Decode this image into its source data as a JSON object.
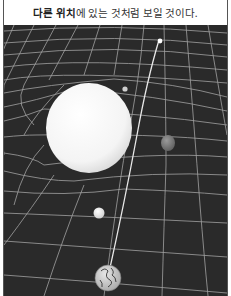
{
  "caption": {
    "bold_text": "다른 위치",
    "rest_text": "에 있는 것처럼 보일 것이다."
  },
  "scene": {
    "description": "Curved spacetime grid with a large white mass bending the path of light from a distant star to Earth",
    "background_color": "#2b2b2b",
    "grid_color": "#bdbdbd",
    "objects": [
      {
        "name": "distant-star",
        "label": "star"
      },
      {
        "name": "large-mass",
        "label": "massive sphere"
      },
      {
        "name": "small-moon",
        "label": "small body"
      },
      {
        "name": "planet",
        "label": "planet"
      },
      {
        "name": "small-planet",
        "label": "small white body"
      },
      {
        "name": "earth",
        "label": "Earth"
      }
    ],
    "light_path": "line from Earth to the apparent star position"
  }
}
